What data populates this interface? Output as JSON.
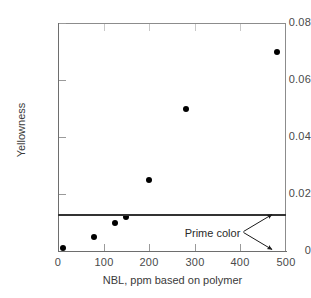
{
  "chart_data": {
    "type": "scatter",
    "title": "",
    "xlabel": "NBL, ppm based on polymer",
    "ylabel": "Yellowness",
    "xlim": [
      0,
      500
    ],
    "ylim": [
      0,
      0.08
    ],
    "grid": false,
    "legend": "none",
    "x_ticks": [
      "0",
      "100",
      "200",
      "300",
      "400",
      "500"
    ],
    "x_tick_values": [
      0,
      100,
      200,
      300,
      400,
      500
    ],
    "y_ticks": [
      "0",
      "0.02",
      "0.04",
      "0.06",
      "0.08"
    ],
    "y_tick_values": [
      0,
      0.02,
      0.04,
      0.06,
      0.08
    ],
    "series": [
      {
        "name": "Yellowness vs NBL",
        "marker": "filled-circle",
        "color": "#000000",
        "x": [
          10,
          78,
          125,
          150,
          200,
          280,
          480
        ],
        "y": [
          0.001,
          0.005,
          0.01,
          0.012,
          0.025,
          0.05,
          0.07
        ]
      }
    ],
    "reference_line": {
      "label": "Prime color",
      "orientation": "horizontal",
      "y": 0.0125,
      "color": "#333333"
    },
    "annotations": [
      {
        "text": "Prime color",
        "x": 405,
        "y": 0.0055
      }
    ]
  },
  "axis": {
    "y_title": "Yellowness",
    "x_title": "NBL, ppm based on polymer"
  },
  "caption": {
    "text": ""
  }
}
